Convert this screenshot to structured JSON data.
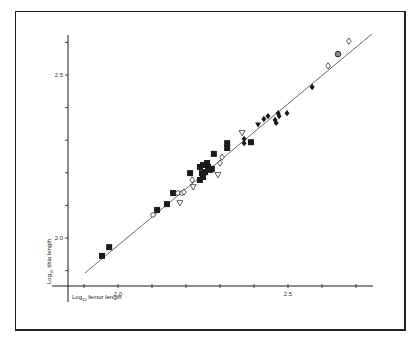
{
  "chart_data": {
    "type": "scatter",
    "title": "",
    "xlabel": "Log10 femur length",
    "ylabel": "Log10 tibia length",
    "xlabel_parts": {
      "base": "Log",
      "sub": "10",
      "rest": " femur length"
    },
    "ylabel_parts": {
      "base": "Log",
      "sub": "10",
      "rest": " tibia length"
    },
    "xlim": [
      1.85,
      2.8
    ],
    "ylim": [
      1.86,
      2.66
    ],
    "x_ticks": [
      1.9,
      2.0,
      2.1,
      2.2,
      2.3,
      2.4,
      2.5,
      2.6,
      2.7
    ],
    "x_tick_labels": [
      {
        "value": 2.0,
        "label": "2.0"
      },
      {
        "value": 2.5,
        "label": "2.5"
      }
    ],
    "y_ticks": [
      1.9,
      2.0,
      2.1,
      2.2,
      2.3,
      2.4,
      2.5,
      2.6
    ],
    "y_tick_labels": [
      {
        "value": 2.0,
        "label": "2.0"
      },
      {
        "value": 2.5,
        "label": "2.5"
      }
    ],
    "grid": false,
    "legend": null,
    "regression_line": {
      "x": [
        1.903,
        2.747
      ],
      "y": [
        1.893,
        2.626
      ]
    },
    "series": [
      {
        "name": "filled square",
        "marker": "square-filled",
        "points": [
          [
            1.953,
            1.945
          ],
          [
            1.974,
            1.972
          ],
          [
            2.115,
            2.086
          ],
          [
            2.144,
            2.104
          ],
          [
            2.162,
            2.138
          ],
          [
            2.212,
            2.199
          ],
          [
            2.241,
            2.218
          ],
          [
            2.25,
            2.224
          ],
          [
            2.262,
            2.23
          ],
          [
            2.265,
            2.218
          ],
          [
            2.276,
            2.212
          ],
          [
            2.247,
            2.199
          ],
          [
            2.241,
            2.178
          ],
          [
            2.25,
            2.187
          ],
          [
            2.256,
            2.202
          ],
          [
            2.271,
            2.209
          ],
          [
            2.282,
            2.258
          ],
          [
            2.321,
            2.291
          ],
          [
            2.321,
            2.276
          ],
          [
            2.391,
            2.294
          ]
        ]
      },
      {
        "name": "open circle",
        "marker": "circle-open",
        "points": [
          [
            2.103,
            2.071
          ],
          [
            2.176,
            2.138
          ],
          [
            2.188,
            2.138
          ]
        ]
      },
      {
        "name": "open triangle",
        "marker": "triangle-down-open",
        "points": [
          [
            2.182,
            2.107
          ],
          [
            2.221,
            2.156
          ],
          [
            2.294,
            2.193
          ],
          [
            2.365,
            2.322
          ]
        ]
      },
      {
        "name": "open diamond",
        "marker": "diamond-open",
        "points": [
          [
            2.194,
            2.141
          ],
          [
            2.218,
            2.178
          ],
          [
            2.3,
            2.23
          ],
          [
            2.306,
            2.248
          ],
          [
            2.618,
            2.528
          ],
          [
            2.679,
            2.604
          ]
        ]
      },
      {
        "name": "filled triangle",
        "marker": "triangle-down-filled",
        "points": [
          [
            2.412,
            2.347
          ]
        ]
      },
      {
        "name": "filled diamond",
        "marker": "diamond-filled",
        "points": [
          [
            2.371,
            2.304
          ],
          [
            2.371,
            2.291
          ],
          [
            2.429,
            2.365
          ],
          [
            2.441,
            2.374
          ],
          [
            2.462,
            2.362
          ],
          [
            2.465,
            2.353
          ],
          [
            2.471,
            2.383
          ],
          [
            2.474,
            2.374
          ],
          [
            2.497,
            2.383
          ],
          [
            2.571,
            2.463
          ]
        ]
      },
      {
        "name": "hatched circle",
        "marker": "circle-hatched",
        "points": [
          [
            2.647,
            2.564
          ]
        ]
      }
    ]
  },
  "colors": {
    "ink": "#1a1a1a",
    "background": "#ffffff"
  }
}
